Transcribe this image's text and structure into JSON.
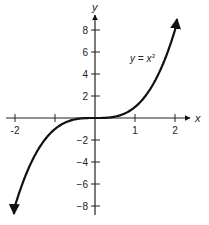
{
  "chart_data": {
    "type": "line",
    "title": "",
    "xlabel": "x",
    "ylabel": "y",
    "xlim": [
      -2.2,
      2.3
    ],
    "ylim": [
      -9,
      9
    ],
    "x_ticks": [
      -2,
      -1,
      0,
      1,
      2
    ],
    "x_tick_labels": [
      "-2",
      "",
      "",
      "1",
      "2"
    ],
    "y_ticks": [
      -8,
      -6,
      -4,
      -2,
      2,
      4,
      6,
      8
    ],
    "y_tick_labels": [
      "−8",
      "−6",
      "−4",
      "−2",
      "2",
      "4",
      "6",
      "8"
    ],
    "grid": false,
    "series": [
      {
        "name": "y = x^3",
        "annotation": "y = x",
        "annotation_exponent": "3",
        "x": [
          -2.0,
          -1.5,
          -1.0,
          -0.5,
          0,
          0.5,
          1.0,
          1.5,
          2.0
        ],
        "y": [
          -8.0,
          -3.375,
          -1.0,
          -0.125,
          0,
          0.125,
          1.0,
          3.375,
          8.0
        ],
        "arrows_at_ends": true
      }
    ]
  }
}
